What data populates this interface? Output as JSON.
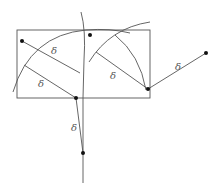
{
  "diagram": {
    "label_symbol": "δ",
    "colors": {
      "line": "#555555",
      "point": "#111111",
      "background": "#ffffff"
    },
    "rectangle": {
      "x": 17,
      "y": 30,
      "width": 133,
      "height": 68
    },
    "points": [
      {
        "id": "A",
        "x": 22,
        "y": 41
      },
      {
        "id": "B",
        "x": 90,
        "y": 35
      },
      {
        "id": "C",
        "x": 148,
        "y": 89
      },
      {
        "id": "D",
        "x": 206,
        "y": 53
      },
      {
        "id": "E",
        "x": 76,
        "y": 98
      },
      {
        "id": "F",
        "x": 83,
        "y": 153
      }
    ],
    "labels": [
      {
        "text": "δ",
        "x": 51,
        "y": 54
      },
      {
        "text": "δ",
        "x": 38,
        "y": 87
      },
      {
        "text": "δ",
        "x": 110,
        "y": 79
      },
      {
        "text": "δ",
        "x": 175,
        "y": 70
      },
      {
        "text": "δ",
        "x": 73,
        "y": 131
      }
    ]
  }
}
